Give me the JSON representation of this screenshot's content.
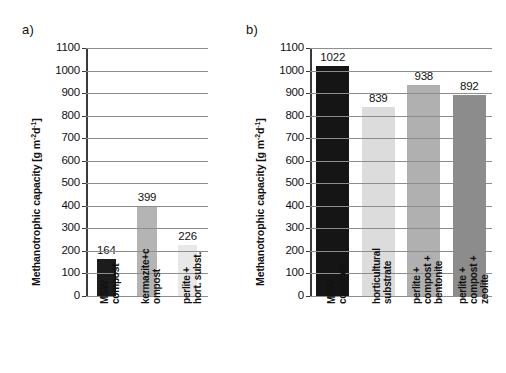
{
  "figure": {
    "panel_a_tag": "a)",
    "panel_b_tag": "b)",
    "axis_title_text": "Methanotrophic capacity [g m",
    "axis_title_sup1": "-2",
    "axis_title_mid": "d",
    "axis_title_sup2": "-1",
    "axis_title_end": "]"
  },
  "chart_data": [
    {
      "type": "bar",
      "panel": "a)",
      "title": "",
      "xlabel": "",
      "ylabel": "Methanotrophic capacity [g m-2d-1]",
      "ylim": [
        0,
        1100
      ],
      "ytick_step": 100,
      "yticks": [
        "1100",
        "1000",
        "900",
        "800",
        "700",
        "600",
        "500",
        "400",
        "300",
        "200",
        "100",
        "0"
      ],
      "grid": true,
      "legend": "none",
      "categories": [
        "MSW compost",
        "kermazite+compost",
        "perlite + hort. subst."
      ],
      "category_lines": [
        [
          "MSW",
          "compost"
        ],
        [
          "kermazite+c",
          "ompost"
        ],
        [
          "perlite +",
          "hort. subst."
        ]
      ],
      "values": [
        164,
        399,
        226
      ],
      "value_labels": [
        "164",
        "399",
        "226"
      ],
      "bar_colors": [
        "#1c1c1c",
        "#b4b4b4",
        "#e8e8e8"
      ]
    },
    {
      "type": "bar",
      "panel": "b)",
      "title": "",
      "xlabel": "",
      "ylabel": "Methanotrophic capacity [g m-2d-1]",
      "ylim": [
        0,
        1100
      ],
      "ytick_step": 100,
      "yticks": [
        "1100",
        "1000",
        "900",
        "800",
        "700",
        "600",
        "500",
        "400",
        "300",
        "200",
        "100",
        "0"
      ],
      "grid": true,
      "legend": "none",
      "categories": [
        "MSW compost",
        "horticultural substrate",
        "perlite + compost + bentonite",
        "perlite + compost + zeolite"
      ],
      "category_lines": [
        [
          "MSW",
          "compost"
        ],
        [
          "horticultural",
          "substrate"
        ],
        [
          "perlite +",
          "compost +",
          "bentonite"
        ],
        [
          "perlite +",
          "compost +",
          "zeolite"
        ]
      ],
      "values": [
        1022,
        839,
        938,
        892
      ],
      "value_labels": [
        "1022",
        "839",
        "938",
        "892"
      ],
      "bar_colors": [
        "#151515",
        "#dcdcdc",
        "#b0b0b0",
        "#8c8c8c"
      ]
    }
  ]
}
